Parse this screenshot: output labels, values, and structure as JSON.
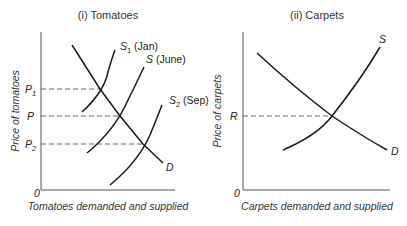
{
  "panels": [
    {
      "title": "(i) Tomatoes",
      "ylabel": "Price of tomatoes",
      "xlabel": "Tomatoes demanded and supplied",
      "origin": "0",
      "price_levels": [
        {
          "label_main": "P",
          "label_sub": "1"
        },
        {
          "label_main": "P",
          "label_sub": ""
        },
        {
          "label_main": "P",
          "label_sub": "2"
        }
      ],
      "curves": [
        {
          "main": "S",
          "sub": "1",
          "suffix": " (Jan)"
        },
        {
          "main": "S",
          "sub": "",
          "suffix": " (June)"
        },
        {
          "main": "S",
          "sub": "2",
          "suffix": " (Sep)"
        },
        {
          "main": "D",
          "sub": "",
          "suffix": ""
        }
      ]
    },
    {
      "title": "(ii) Carpets",
      "ylabel": "Price of carpets",
      "xlabel": "Carpets demanded and supplied",
      "origin": "0",
      "price_levels": [
        {
          "label_main": "R",
          "label_sub": ""
        }
      ],
      "curves": [
        {
          "main": "S",
          "sub": "",
          "suffix": ""
        },
        {
          "main": "D",
          "sub": "",
          "suffix": ""
        }
      ]
    }
  ]
}
